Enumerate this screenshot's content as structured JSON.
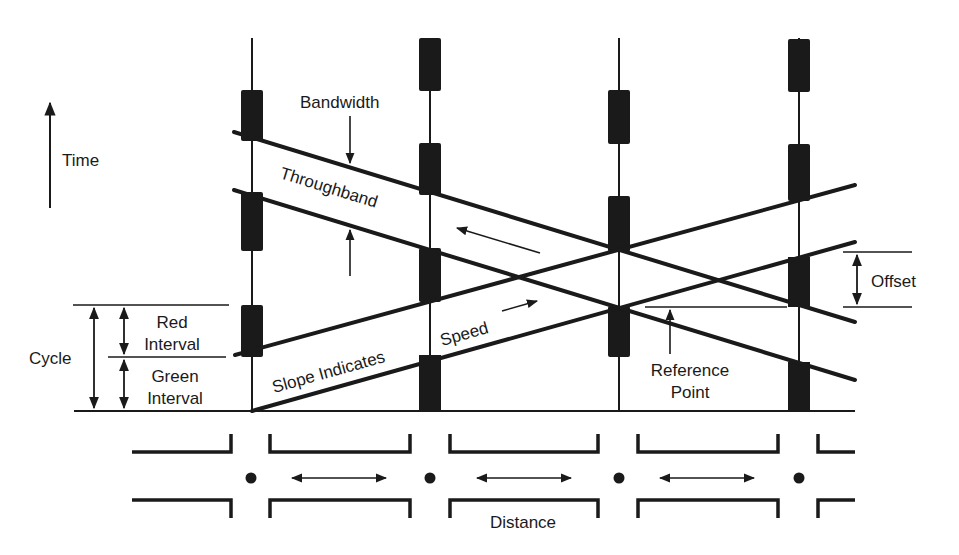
{
  "colors": {
    "background": "#ffffff",
    "ink": "#1a1a1a"
  },
  "axes": {
    "time_label": "Time",
    "distance_label": "Distance"
  },
  "labels": {
    "bandwidth": "Bandwidth",
    "throughband": "Throughband",
    "offset": "Offset",
    "cycle": "Cycle",
    "red_interval_line1": "Red",
    "red_interval_line2": "Interval",
    "green_interval_line1": "Green",
    "green_interval_line2": "Interval",
    "slope_indicates": "Slope Indicates",
    "speed": "Speed",
    "reference_point_line1": "Reference",
    "reference_point_line2": "Point"
  },
  "intersections": [
    {
      "id": 1,
      "x": 252,
      "red_phases": [
        [
          90,
          141
        ],
        [
          192,
          251
        ],
        [
          305,
          357
        ]
      ]
    },
    {
      "id": 2,
      "x": 430,
      "red_phases": [
        [
          38,
          91
        ],
        [
          143,
          195
        ],
        [
          248,
          302
        ],
        [
          355,
          411
        ]
      ]
    },
    {
      "id": 3,
      "x": 619,
      "red_phases": [
        [
          90,
          144
        ],
        [
          196,
          252
        ],
        [
          306,
          357
        ]
      ]
    },
    {
      "id": 4,
      "x": 799,
      "red_phases": [
        [
          39,
          92
        ],
        [
          144,
          201
        ],
        [
          257,
          307
        ],
        [
          362,
          411
        ]
      ]
    }
  ],
  "bands": [
    {
      "name": "westbound-throughband",
      "direction": "descending",
      "upper": [
        [
          234,
          132
        ],
        [
          855,
          322
        ]
      ],
      "lower": [
        [
          234,
          190
        ],
        [
          855,
          380
        ]
      ]
    },
    {
      "name": "eastbound-throughband",
      "direction": "ascending",
      "upper": [
        [
          235,
          355
        ],
        [
          855,
          185
        ]
      ],
      "lower": [
        [
          252,
          411
        ],
        [
          855,
          242
        ]
      ]
    }
  ]
}
